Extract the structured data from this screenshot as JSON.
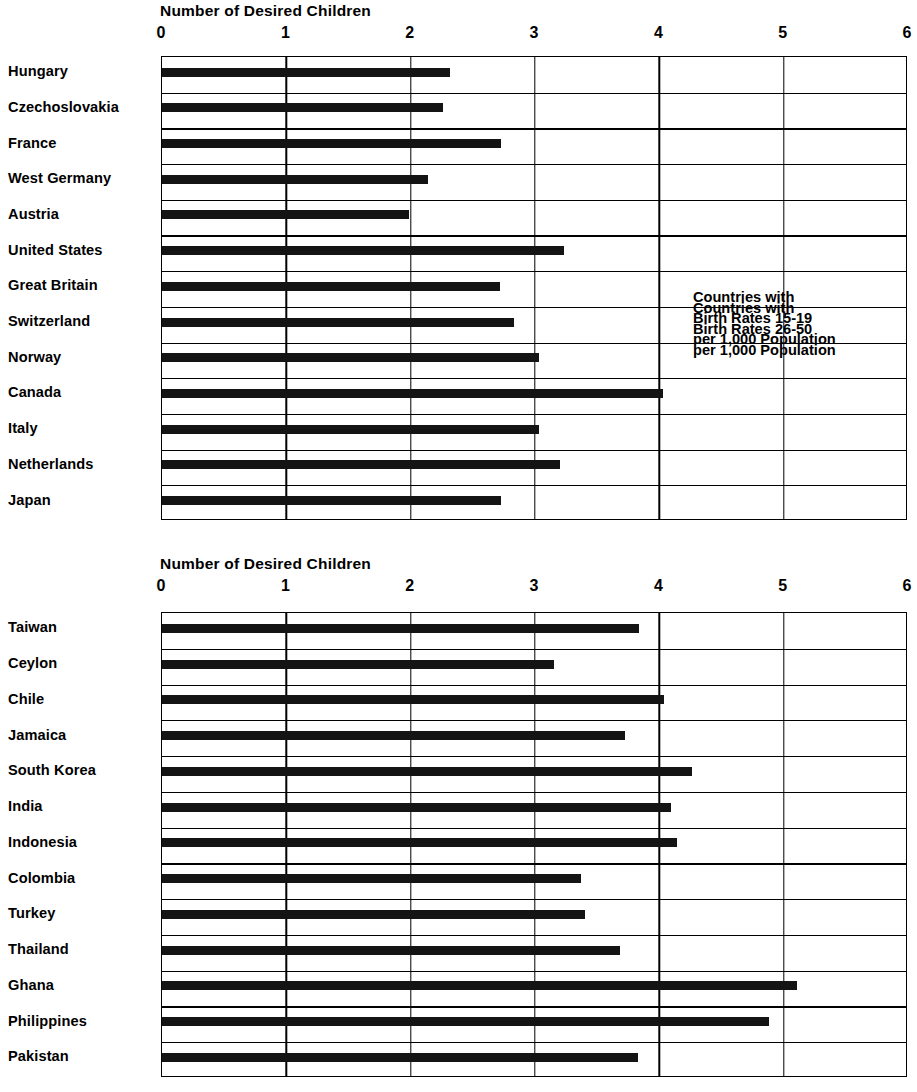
{
  "chart_data": [
    {
      "type": "bar",
      "orientation": "horizontal",
      "title": "Number of Desired Children",
      "xlabel": "Number of Desired Children",
      "ylabel": "",
      "xlim": [
        0,
        6
      ],
      "xticks": [
        "0",
        "1",
        "2",
        "3",
        "4",
        "5",
        "6"
      ],
      "grid": true,
      "legend": "none",
      "annotation": "Countries with\nBirth Rates 15-19\nper 1,000 Population",
      "annotation_lines": [
        "Countries with",
        "Birth Rates 15-19",
        "per 1,000 Population"
      ],
      "categories": [
        "Hungary",
        "Czechoslovakia",
        "France",
        "West Germany",
        "Austria",
        "United States",
        "Great Britain",
        "Switzerland",
        "Norway",
        "Canada",
        "Italy",
        "Netherlands",
        "Japan"
      ],
      "values": [
        2.32,
        2.26,
        2.73,
        2.14,
        1.99,
        3.23,
        2.72,
        2.83,
        3.03,
        4.03,
        3.03,
        3.2,
        2.73
      ]
    },
    {
      "type": "bar",
      "orientation": "horizontal",
      "title": "Number of Desired Children",
      "xlabel": "Number of Desired Children",
      "ylabel": "",
      "xlim": [
        0,
        6
      ],
      "xticks": [
        "0",
        "1",
        "2",
        "3",
        "4",
        "5",
        "6"
      ],
      "grid": true,
      "legend": "none",
      "annotation": "Countries with\nBirth Rates 26-50\nper 1,000 Population",
      "annotation_lines": [
        "Countries with",
        "Birth Rates 26-50",
        "per 1,000 Population"
      ],
      "categories": [
        "Taiwan",
        "Ceylon",
        "Chile",
        "Jamaica",
        "South Korea",
        "India",
        "Indonesia",
        "Colombia",
        "Turkey",
        "Thailand",
        "Ghana",
        "Philippines",
        "Pakistan"
      ],
      "values": [
        3.84,
        3.15,
        4.04,
        3.72,
        4.26,
        4.09,
        4.14,
        3.37,
        3.4,
        3.68,
        5.11,
        4.88,
        3.83
      ]
    }
  ],
  "panels": [
    {
      "id": "panel-0",
      "title": "Number of Desired Children",
      "annotation_lines": [
        "Countries with",
        "Birth Rates 15-19",
        "per 1,000 Population"
      ]
    },
    {
      "id": "panel-1",
      "title": "Number of Desired Children",
      "annotation_lines": [
        "Countries with",
        "Birth Rates 26-50",
        "per 1,000 Population"
      ]
    }
  ],
  "style": {
    "bar_color": "#141414",
    "axis_color": "#000000",
    "background": "#ffffff"
  }
}
